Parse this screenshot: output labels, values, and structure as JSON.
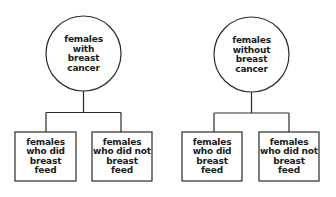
{
  "diagram": {
    "type": "tree",
    "stroke_color": "#2a2a2a",
    "groups": [
      {
        "root": {
          "shape": "circle",
          "lines": [
            "females",
            "with",
            "breast",
            "cancer"
          ]
        },
        "children": [
          {
            "shape": "box",
            "lines": [
              "females",
              "who did",
              "breast",
              "feed"
            ]
          },
          {
            "shape": "box",
            "lines": [
              "females",
              "who did not",
              "breast",
              "feed"
            ]
          }
        ]
      },
      {
        "root": {
          "shape": "circle",
          "lines": [
            "females",
            "without",
            "breast",
            "cancer"
          ]
        },
        "children": [
          {
            "shape": "box",
            "lines": [
              "females",
              "who did",
              "breast",
              "feed"
            ]
          },
          {
            "shape": "box",
            "lines": [
              "females",
              "who did not",
              "breast",
              "feed"
            ]
          }
        ]
      }
    ]
  }
}
